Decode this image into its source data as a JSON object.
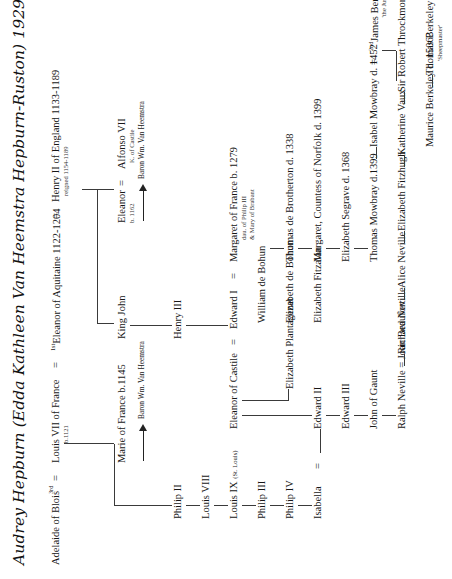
{
  "document": {
    "type": "genealogy-chart",
    "title": "Audrey Hepburn (Edda Kathleen Van Heemstra Hepburn-Ruston) 1929-1993",
    "ink_color": "#171717",
    "rule_color": "#3a3a3a",
    "background": "#ffffff",
    "orientation": "text rotated 90 degrees counter-clockwise"
  },
  "marriage_sign": "=",
  "generation_1": {
    "adelaide": {
      "name": "Adelaide of Blois",
      "ordinal": "3rd"
    },
    "louis7": {
      "name": "Louis VII of France",
      "sub": "b.1121"
    },
    "eleanor_aquitaine": {
      "ordinal": "1st",
      "name": "Eleanor of Aquitaine 1122-1204"
    },
    "henry2": {
      "name": "Henry II of England 1133-1189",
      "sub": "reigned 1154-1189"
    }
  },
  "generation_2": {
    "marie": {
      "name": "Marie of France  b.1145"
    },
    "king_john": {
      "name": "King John"
    },
    "eleanor": {
      "name": "Eleanor",
      "sub": "b. 1162"
    },
    "alfonso": {
      "name": "Alfonso VII",
      "sub": "K. of Castile"
    },
    "heemstra_left": {
      "name": "Baron Wm. Van Heemstra"
    },
    "heemstra_right": {
      "name": "Baron Wm. Van Heemstra"
    }
  },
  "french_line": [
    {
      "name": "Philip II"
    },
    {
      "name": "Louis VIII"
    },
    {
      "name": "Louis IX",
      "suffix": "(St. Louis)"
    },
    {
      "name": "Philip III"
    },
    {
      "name": "Philip IV"
    },
    {
      "name": "Isabella"
    }
  ],
  "english_line": {
    "henry3": {
      "name": "Henry III"
    },
    "eleanor_castile": {
      "name": "Eleanor of Castile"
    },
    "edward1": {
      "name": "Edward I"
    },
    "margaret_france": {
      "name": "Margaret of France b. 1279",
      "sub1": "dau. of Philip III",
      "sub2": "& Mary of Brabant"
    },
    "edward2": {
      "name": "Edward II"
    },
    "edward3": {
      "name": "Edward III"
    },
    "john_of_gaunt": {
      "name": "John of Gaunt"
    }
  },
  "bohun_branch": [
    {
      "name": "Elizabeth Plantagenet"
    },
    {
      "name": "William de Bohun"
    },
    {
      "name": "Elizabeth de Bohun"
    },
    {
      "name": "Elizabeth Fitzalan"
    }
  ],
  "mowbray_branch": [
    {
      "name": "Thomas de Brotherton d. 1338"
    },
    {
      "name": "Margaret, Countess of Norfolk d. 1399"
    },
    {
      "name": "Elizabeth Segrave d.  1368"
    },
    {
      "name": "Thomas Mowbray d.1399"
    }
  ],
  "berkeley_branch": {
    "isabel_mowbray": {
      "name": "Isabel Mowbray d. 1452"
    },
    "james_berkeley": {
      "ordinal": "2nd",
      "name": "James Berkeley",
      "sub": "'the Just'"
    },
    "maurice_berkeley": {
      "name": "Maurice Berkeley d. 1506?"
    },
    "thomas_berkeley": {
      "name": "Thomas Berkeley d. 1533",
      "sub": "'Sheepmaster'"
    },
    "muriel_berkeley": {
      "name": "Muriel Berkeley 1516-1541"
    }
  },
  "neville_branch": [
    {
      "name": "Ralph Neville = Joan Beaufort"
    },
    {
      "name": "Richard Neville"
    },
    {
      "name": "Alice Neville"
    },
    {
      "name": "Elizabeth Fitzhugh"
    },
    {
      "name": "Katherine Vaux"
    },
    {
      "name": "Sir Robert Throckmorton d.1581"
    }
  ]
}
